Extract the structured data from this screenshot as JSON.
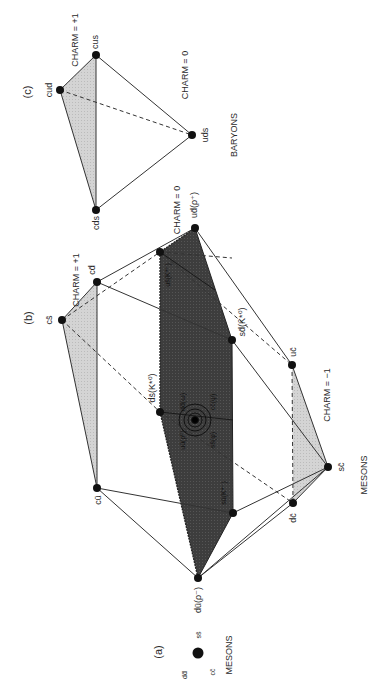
{
  "figure": {
    "panel_a": {
      "label": "(a)",
      "title": "MESONS",
      "states": [
        "dd̄",
        "ss̄",
        "cc̄"
      ]
    },
    "panel_b": {
      "label": "(b)",
      "title": "MESONS",
      "charm_levels": [
        "CHARM = +1",
        "CHARM = 0",
        "CHARM = −1"
      ],
      "vertices": {
        "cs": "cs̄",
        "cd": "cd̄",
        "cu": "cū",
        "ud": "ud̄(ρ⁺)",
        "du": "dū(ρ⁻)",
        "us": "us̄(K*⁺)",
        "ds": "ds̄(K*⁰)",
        "sd": "sd̄(K̄*⁰)",
        "su": "sū(K*⁻)",
        "uc": "uc̄",
        "sc": "sc̄",
        "dc": "dc̄"
      },
      "center_labels": [
        "dd̄(ω)",
        "cc̄(ψ)",
        "uū(ρ⁰)",
        "ss̄(φ)"
      ]
    },
    "panel_c": {
      "label": "(c)",
      "title": "BARYONS",
      "charm_levels": [
        "CHARM = +1",
        "CHARM = 0"
      ],
      "vertices": {
        "cus": "cus",
        "cud": "cud",
        "cds": "cds",
        "uds": "uds"
      }
    },
    "colors": {
      "dark_plane": "#3c3c3c",
      "light_face": "#cfcfcf",
      "line": "#333333",
      "node": "#111111"
    }
  }
}
